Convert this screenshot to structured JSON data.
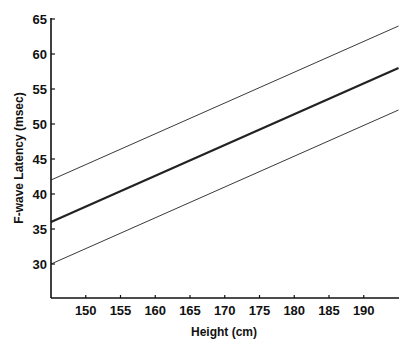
{
  "chart_data": {
    "type": "line",
    "title": "",
    "xlabel": "Height (cm)",
    "ylabel": "F-wave Latency (msec)",
    "xlim": [
      145,
      195
    ],
    "ylim": [
      25,
      65
    ],
    "x_ticks": [
      150,
      155,
      160,
      165,
      170,
      175,
      180,
      185,
      190
    ],
    "y_ticks": [
      30,
      35,
      40,
      45,
      50,
      55,
      60,
      65
    ],
    "grid": false,
    "legend": null,
    "series": [
      {
        "name": "upper limit",
        "style": "thin",
        "x": [
          145,
          195
        ],
        "y": [
          42,
          64
        ]
      },
      {
        "name": "mean",
        "style": "thick",
        "x": [
          145,
          195
        ],
        "y": [
          36,
          58
        ]
      },
      {
        "name": "lower limit",
        "style": "thin",
        "x": [
          145,
          195
        ],
        "y": [
          30,
          52
        ]
      }
    ]
  },
  "colors": {
    "line": "#222222",
    "axis": "#111111",
    "background": "#ffffff"
  }
}
